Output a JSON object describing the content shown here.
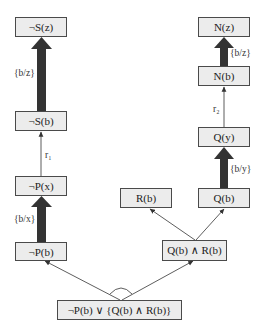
{
  "diagram": {
    "nodes": {
      "not_s_z": "¬S(z)",
      "not_s_b": "¬S(b)",
      "not_p_x": "¬P(x)",
      "not_p_b": "¬P(b)",
      "n_z": "N(z)",
      "n_b": "N(b)",
      "q_y": "Q(y)",
      "q_b": "Q(b)",
      "r_b": "R(b)",
      "q_and_r": "Q(b) ∧ R(b)",
      "root": "¬P(b) ∨ {Q(b) ∧ R(b)}"
    },
    "edge_labels": {
      "b_z_left": "{b/z}",
      "r1": "r₁",
      "b_x": "{b/x}",
      "b_z_right": "{b/z}",
      "r2": "r₂",
      "b_y": "{b/y}"
    },
    "colors": {
      "node_fill": "#ececec",
      "node_border": "#4a4a4a",
      "thick_arrow": "#333333",
      "thin_arrow": "#333333"
    }
  }
}
